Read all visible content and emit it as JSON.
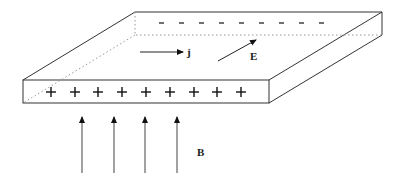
{
  "diagram": {
    "labels": {
      "current": "j",
      "field_e": "E",
      "field_b": "B"
    },
    "charges": {
      "negative_symbol": "-",
      "negative_count": 10,
      "positive_symbol": "+",
      "positive_count": 9
    },
    "b_arrow_count": 4,
    "colors": {
      "line": "#333333",
      "dotted": "#888888",
      "background": "#ffffff"
    }
  }
}
